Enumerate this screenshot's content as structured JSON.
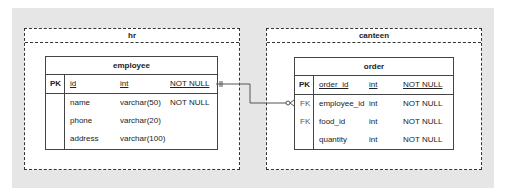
{
  "groups": [
    {
      "name": "hr"
    },
    {
      "name": "canteen"
    }
  ],
  "tables": {
    "employee": {
      "title": "employee",
      "rows": [
        {
          "key": "PK",
          "name": "id",
          "type": "int",
          "constraint": "NOT NULL"
        },
        {
          "key": "",
          "name": "name",
          "type": "varchar(50)",
          "constraint": "NOT NULL"
        },
        {
          "key": "",
          "name": "phone",
          "type": "varchar(20)",
          "constraint": ""
        },
        {
          "key": "",
          "name": "address",
          "type": "varchar(100)",
          "constraint": ""
        }
      ]
    },
    "order": {
      "title": "order",
      "rows": [
        {
          "key": "PK",
          "name": "order_id",
          "type": "int",
          "constraint": "NOT NULL"
        },
        {
          "key": "FK",
          "name": "employee_id",
          "type": "int",
          "constraint": "NOT NULL"
        },
        {
          "key": "FK",
          "name": "food_id",
          "type": "int",
          "constraint": "NOT NULL"
        },
        {
          "key": "",
          "name": "quantity",
          "type": "int",
          "constraint": "NOT NULL"
        }
      ]
    }
  },
  "relationship": {
    "from": "employee.id",
    "to": "order.employee_id",
    "from_cardinality": "one-and-only-one",
    "to_cardinality": "zero-or-many"
  }
}
